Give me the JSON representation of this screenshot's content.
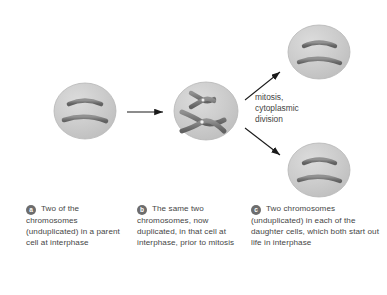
{
  "figure": {
    "type": "biology-diagram",
    "process_label": {
      "line1": "mitosis,",
      "line2": "cytoplasmic",
      "line3": "division"
    },
    "colors": {
      "cell_fill": "#c9c9c9",
      "cell_edge": "#b3b3b3",
      "chromosome": "#7d7d7d",
      "chromosome_edge": "#5f5f5f",
      "centromere": "#f2f2f2",
      "arrow": "#1a1a1a",
      "text": "#454545",
      "bullet_bg": "#6d6d6d",
      "bullet_text": "#ffffff",
      "background": "#ffffff"
    },
    "cells": [
      {
        "id": "parent-cell",
        "stage": "interphase",
        "chromosome_count": 2,
        "chromosome_state": "unduplicated",
        "chromosome_shape": "rod"
      },
      {
        "id": "duplicated-cell",
        "stage": "interphase, prior to mitosis",
        "chromosome_count": 2,
        "chromosome_state": "duplicated",
        "chromosome_shape": "x-shaped sister chromatids"
      },
      {
        "id": "daughter-cell-top",
        "stage": "interphase",
        "chromosome_count": 2,
        "chromosome_state": "unduplicated",
        "chromosome_shape": "rod"
      },
      {
        "id": "daughter-cell-bottom",
        "stage": "interphase",
        "chromosome_count": 2,
        "chromosome_state": "unduplicated",
        "chromosome_shape": "rod"
      }
    ],
    "arrows": [
      {
        "id": "arrow-duplication",
        "direction": "right"
      },
      {
        "id": "arrow-mitosis-up",
        "direction": "up-right"
      },
      {
        "id": "arrow-mitosis-down",
        "direction": "down-right"
      }
    ]
  },
  "captions": [
    {
      "marker": "a",
      "lines": [
        "Two of the",
        "chromosomes",
        "(unduplicated)",
        "in a parent cell",
        "at interphase"
      ],
      "text": "Two of the chromosomes (unduplicated) in a parent cell at interphase"
    },
    {
      "marker": "b",
      "lines": [
        "The same two",
        "chromosomes, now",
        "duplicated, in that",
        "cell at interphase,",
        "prior to mitosis"
      ],
      "text": "The same two chromosomes, now duplicated, in that cell at interphase, prior to mitosis"
    },
    {
      "marker": "c",
      "lines": [
        "Two chromosomes",
        "(unduplicated) in each",
        "of the daughter cells,",
        "which both start out",
        "life in interphase"
      ],
      "text": "Two chromosomes (unduplicated) in each of the daughter cells, which both start out life in interphase"
    }
  ]
}
